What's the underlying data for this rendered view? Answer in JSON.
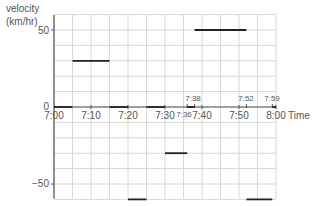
{
  "chart_data": {
    "type": "line",
    "title": "",
    "xlabel": "Time",
    "ylabel": "velocity (km/hr)",
    "ylabel_lines": [
      "velocity",
      "(km/hr)"
    ],
    "x_ticks": [
      "7:00",
      "7:10",
      "7:20",
      "7:30",
      "7:40",
      "7:50",
      "8:00"
    ],
    "x_extra_ticks_below": [
      "7:36"
    ],
    "x_extra_ticks_above": [
      "7:38",
      "7:52",
      "7:59"
    ],
    "y_ticks": [
      50,
      0,
      -50
    ],
    "y_tick_labels": [
      "50",
      "0",
      "−50"
    ],
    "xlim_minutes": [
      0,
      60
    ],
    "ylim": [
      -60,
      60
    ],
    "grid": true,
    "grid_x_step_minutes": 5,
    "grid_y_step": 10,
    "segments": [
      {
        "start": "7:00",
        "end": "7:05",
        "velocity": 0
      },
      {
        "start": "7:05",
        "end": "7:15",
        "velocity": 30
      },
      {
        "start": "7:15",
        "end": "7:20",
        "velocity": 0
      },
      {
        "start": "7:20",
        "end": "7:25",
        "velocity": -60
      },
      {
        "start": "7:25",
        "end": "7:30",
        "velocity": 0
      },
      {
        "start": "7:30",
        "end": "7:36",
        "velocity": -30
      },
      {
        "start": "7:36",
        "end": "7:38",
        "velocity": 0
      },
      {
        "start": "7:38",
        "end": "7:52",
        "velocity": 50
      },
      {
        "start": "7:52",
        "end": "7:59",
        "velocity": -60
      },
      {
        "start": "7:59",
        "end": "8:00",
        "velocity": 0
      }
    ]
  },
  "axes": {
    "ylabel_line1": "velocity",
    "ylabel_line2": "(km/hr)",
    "xlabel": "Time",
    "y50": "50",
    "y0": "0",
    "yneg50": "−50",
    "x700": "7:00",
    "x710": "7:10",
    "x720": "7:20",
    "x730": "7:30",
    "x736": "7:36",
    "x740": "7:40",
    "x750": "7:50",
    "x800": "8:00",
    "x738": "7:38",
    "x752": "7:52",
    "x759": "7:59"
  },
  "colors": {
    "grid": "#d8d8d8",
    "axis": "#555555",
    "segment": "#222222",
    "text": "#555555"
  }
}
